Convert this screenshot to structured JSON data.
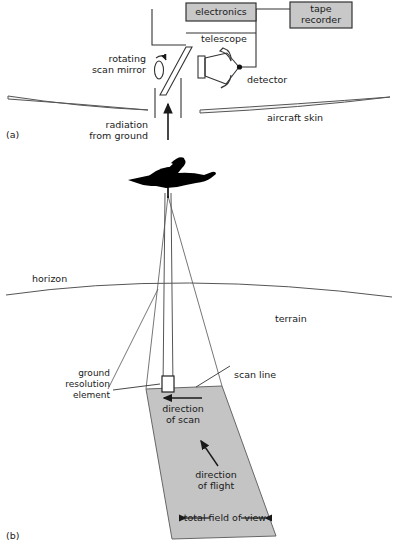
{
  "figure": {
    "panels": [
      {
        "id": "a",
        "id_label": "(a)",
        "title_hidden": "",
        "labels": {
          "electronics": "electronics",
          "tape_recorder_line1": "tape",
          "tape_recorder_line2": "recorder",
          "telescope": "telescope",
          "detector": "detector",
          "rotating_line1": "rotating",
          "rotating_line2": "scan mirror",
          "radiation_line1": "radiation",
          "radiation_line2": "from ground",
          "aircraft_skin": "aircraft skin"
        }
      },
      {
        "id": "b",
        "id_label": "(b)",
        "labels": {
          "horizon": "horizon",
          "terrain": "terrain",
          "scan_line": "scan line",
          "ground_res_line1": "ground",
          "ground_res_line2": "resolution",
          "ground_res_line3": "element",
          "dir_scan_line1": "direction",
          "dir_scan_line2": "of scan",
          "dir_flight_line1": "direction",
          "dir_flight_line2": "of flight",
          "total_fov": "total field of view"
        }
      }
    ],
    "colors": {
      "box_fill": "#c8c8c8",
      "box_stroke": "#333333",
      "swath_fill": "#c4c4c4",
      "swath_stroke": "#555555",
      "line": "#444444",
      "aircraft": "#000000",
      "text": "#1a1a1a",
      "background": "#ffffff"
    }
  }
}
